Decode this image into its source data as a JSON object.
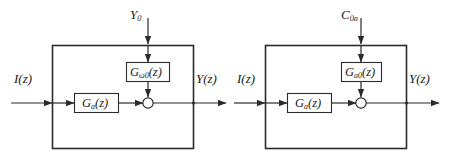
{
  "figure": {
    "type": "block-diagram",
    "background_color": "#ffffff",
    "line_color": "#2b2b2b",
    "text_color": "#1a1a1a",
    "panel_count": 2
  },
  "panels": [
    {
      "id": "left-panel",
      "top_input": {
        "symbol": "Y",
        "subscript": "0"
      },
      "left_input": {
        "symbol": "I",
        "arg": "(z)"
      },
      "right_output": {
        "symbol": "Y",
        "arg": "(z)"
      },
      "forward_block": {
        "symbol": "G",
        "subscript": "a",
        "arg": "(z)"
      },
      "feed_block": {
        "symbol": "G",
        "subscript": "ω0",
        "arg": "(z)"
      },
      "summing_junction": "open-circle"
    },
    {
      "id": "right-panel",
      "top_input": {
        "symbol": "C",
        "subscript": "0a"
      },
      "left_input": {
        "symbol": "I",
        "arg": "(z)"
      },
      "right_output": {
        "symbol": "Y",
        "arg": "(z)"
      },
      "forward_block": {
        "symbol": "G",
        "subscript": "a",
        "arg": "(z)"
      },
      "feed_block": {
        "symbol": "G",
        "subscript": "a0",
        "arg": "(z)"
      },
      "summing_junction": "open-circle"
    }
  ]
}
